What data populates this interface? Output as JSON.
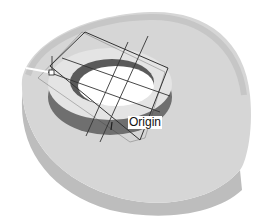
{
  "diagram": {
    "type": "3D CAD part view",
    "labels": {
      "origin": "Origin"
    },
    "colors": {
      "base_top": "#d6d6d6",
      "base_side": "#bdbdbd",
      "ring_top": "#e4e4e4",
      "ring_wall": "#7a7a7a",
      "hole": "#ffffff",
      "plane_lines": "#333333",
      "background": "#ffffff"
    },
    "elements": [
      "base-plate",
      "ring-boss",
      "center-hole",
      "sketch-plane",
      "crosshair-lines",
      "handle-point",
      "direction-arrow",
      "origin-label"
    ]
  }
}
